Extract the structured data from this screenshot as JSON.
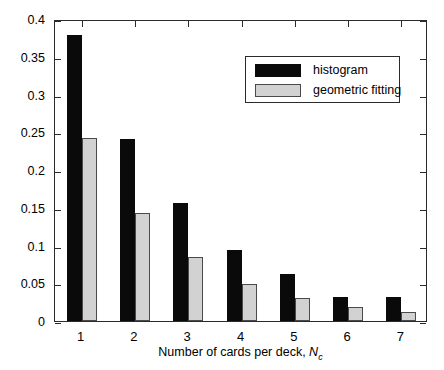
{
  "chart_data": {
    "type": "bar",
    "title": "",
    "xlabel": "Number of cards per deck, N_c",
    "xlabel_text": "Number of cards per deck, ",
    "xlabel_var": "N",
    "xlabel_sub": "c",
    "ylabel": "Probability",
    "categories": [
      "1",
      "2",
      "3",
      "4",
      "5",
      "6",
      "7"
    ],
    "series": [
      {
        "name": "histogram",
        "color": "#0a0a0a",
        "values": [
          0.379,
          0.241,
          0.156,
          0.094,
          0.062,
          0.032,
          0.032
        ]
      },
      {
        "name": "geometric fitting",
        "color": "#d2d2d2",
        "values": [
          0.242,
          0.143,
          0.085,
          0.049,
          0.03,
          0.019,
          0.012
        ]
      }
    ],
    "ylim": [
      0,
      0.4
    ],
    "yticks": [
      0,
      0.05,
      0.1,
      0.15,
      0.2,
      0.25,
      0.3,
      0.35,
      0.4
    ],
    "ytick_labels": [
      "0",
      "0.05",
      "0.1",
      "0.15",
      "0.2",
      "0.25",
      "0.3",
      "0.35",
      "0.4"
    ],
    "xtick_labels": [
      "1",
      "2",
      "3",
      "4",
      "5",
      "6",
      "7"
    ],
    "grid": false,
    "legend_position": "upper right"
  },
  "legend": {
    "entries": [
      {
        "label": "histogram"
      },
      {
        "label": "geometric fitting"
      }
    ]
  }
}
